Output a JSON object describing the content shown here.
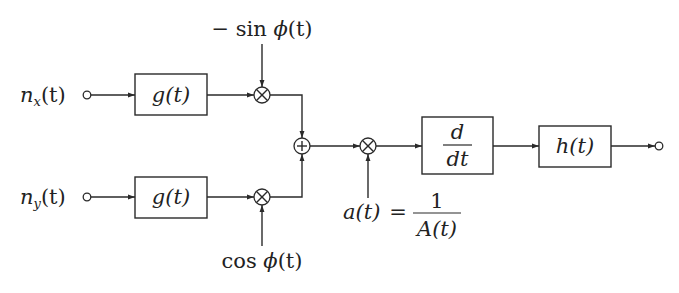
{
  "diagram": {
    "type": "block-diagram",
    "inputs": {
      "nx": {
        "name": "n",
        "sub": "x",
        "arg": "(t)"
      },
      "ny": {
        "name": "n",
        "sub": "y",
        "arg": "(t)"
      }
    },
    "blocks": {
      "filter_top": "g(t)",
      "filter_bottom": "g(t)",
      "derivative_num": "d",
      "derivative_den": "dt",
      "output_filter": "h(t)"
    },
    "multiplier_inputs": {
      "top": {
        "prefix": "− sin ",
        "phi": "ϕ",
        "arg": "(t)"
      },
      "bottom": {
        "prefix": "cos ",
        "phi": "ϕ",
        "arg": "(t)"
      }
    },
    "gain": {
      "lhs": "a(t)",
      "eq": "=",
      "num": "1",
      "den": "A(t)"
    },
    "nodes": {
      "multiply_symbol": "⊗",
      "sum_symbol": "⊕"
    },
    "colors": {
      "line": "#2a2a2a",
      "text": "#222222",
      "background": "#ffffff"
    }
  }
}
